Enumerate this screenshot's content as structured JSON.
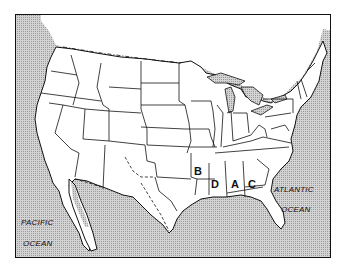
{
  "map": {
    "title": "Contiguous United States outline map",
    "water_labels": {
      "atlantic_line1": "ATLANTIC",
      "atlantic_line2": "OCEAN",
      "pacific_line1": "PACIFIC",
      "pacific_line2": "OCEAN"
    },
    "state_markers": [
      {
        "letter": "B",
        "state": "Arkansas"
      },
      {
        "letter": "D",
        "state": "Mississippi"
      },
      {
        "letter": "A",
        "state": "Alabama"
      },
      {
        "letter": "C",
        "state": "Georgia"
      }
    ],
    "colors": {
      "water": "#c8c8c8",
      "land": "#ffffff",
      "border": "#111111"
    }
  }
}
